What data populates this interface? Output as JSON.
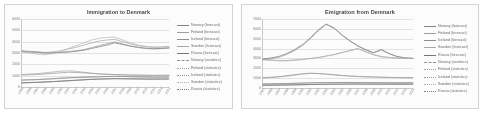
{
  "charts": [
    {
      "id": "immigration",
      "title": "Immigration to Denmark",
      "chart_data": {
        "type": "line",
        "title": "Immigration to Denmark",
        "xlabel": "",
        "ylabel": "",
        "ylim": [
          0,
          6000
        ],
        "yticks": [
          6000,
          5000,
          4000,
          3000,
          2000,
          1000,
          0
        ],
        "grid": true,
        "legend_position": "right",
        "categories": [
          "1995",
          "1996",
          "1997",
          "1998",
          "1999",
          "2000",
          "2001",
          "2002",
          "2003",
          "2004",
          "2005",
          "2006",
          "2007",
          "2008",
          "2009",
          "2010",
          "2011",
          "2012",
          "2013",
          "2014"
        ],
        "series": [
          {
            "name": "Norway (forecast)",
            "style": "solid",
            "color": "#7f7f7f",
            "values": [
              3120,
              3080,
              3050,
              3000,
              3020,
              3050,
              3080,
              3150,
              3250,
              3400,
              3550,
              3700,
              3900,
              3750,
              3620,
              3500,
              3420,
              3380,
              3400,
              3450
            ]
          },
          {
            "name": "Finland (forecast)",
            "style": "solid",
            "color": "#9a9a9a",
            "values": [
              1050,
              1080,
              1100,
              1150,
              1200,
              1250,
              1300,
              1280,
              1250,
              1200,
              1150,
              1120,
              1100,
              1080,
              1060,
              1050,
              1040,
              1030,
              1030,
              1040
            ]
          },
          {
            "name": "Iceland (forecast)",
            "style": "solid",
            "color": "#8c8c8c",
            "values": [
              620,
              640,
              660,
              690,
              720,
              760,
              800,
              830,
              860,
              880,
              900,
              920,
              940,
              930,
              910,
              890,
              880,
              870,
              870,
              880
            ]
          },
          {
            "name": "Sweden (forecast)",
            "style": "solid",
            "color": "#a5a5a5",
            "values": [
              3150,
              3100,
              3080,
              3050,
              3100,
              3200,
              3350,
              3500,
              3700,
              3900,
              4050,
              4150,
              4200,
              4000,
              3800,
              3650,
              3550,
              3500,
              3520,
              3560
            ]
          },
          {
            "name": "Russia (forecast)",
            "style": "solid",
            "color": "#707070",
            "values": [
              380,
              400,
              420,
              450,
              480,
              520,
              560,
              600,
              640,
              680,
              700,
              720,
              740,
              730,
              720,
              710,
              700,
              700,
              700,
              710
            ]
          },
          {
            "name": "Norway (statistics)",
            "style": "dashed",
            "color": "#8f8f8f",
            "values": [
              3200,
              3150,
              3100,
              3020,
              3000,
              3050,
              3120,
              3200,
              3300,
              3480,
              3650,
              3820,
              3980,
              3800,
              3600,
              3480,
              3400,
              3360,
              3390,
              3440
            ]
          },
          {
            "name": "Finland (statistics)",
            "style": "dotted",
            "color": "#a0a0a0",
            "values": [
              1100,
              1150,
              1180,
              1250,
              1320,
              1400,
              1420,
              1380,
              1300,
              1220,
              1160,
              1120,
              1100,
              1070,
              1050,
              1040,
              1030,
              1020,
              1025,
              1035
            ]
          },
          {
            "name": "Iceland (statistics)",
            "style": "dotted",
            "color": "#959595",
            "values": [
              600,
              630,
              650,
              700,
              740,
              790,
              820,
              850,
              870,
              890,
              910,
              930,
              950,
              935,
              915,
              895,
              885,
              875,
              875,
              885
            ]
          },
          {
            "name": "Sweden (statistics)",
            "style": "dotted",
            "color": "#b0b0b0",
            "values": [
              3100,
              3000,
              2900,
              2850,
              2950,
              3150,
              3400,
              3650,
              3900,
              4150,
              4300,
              4380,
              4400,
              4150,
              3900,
              3700,
              3580,
              3520,
              3540,
              3580
            ]
          },
          {
            "name": "Russia (statistics)",
            "style": "dotted",
            "color": "#787878",
            "values": [
              350,
              380,
              410,
              440,
              470,
              510,
              550,
              590,
              630,
              670,
              695,
              715,
              735,
              725,
              715,
              705,
              698,
              698,
              700,
              705
            ]
          }
        ]
      }
    },
    {
      "id": "emigration",
      "title": "Emigration from Denmark",
      "chart_data": {
        "type": "line",
        "title": "Emigration from Denmark",
        "xlabel": "",
        "ylabel": "",
        "ylim": [
          0,
          7000
        ],
        "yticks": [
          7000,
          6000,
          5000,
          4000,
          3000,
          2000,
          1000,
          0
        ],
        "grid": true,
        "legend_position": "right",
        "categories": [
          "1995",
          "1996",
          "1997",
          "1998",
          "1999",
          "2000",
          "2001",
          "2002",
          "2003",
          "2004",
          "2005",
          "2006",
          "2007",
          "2008",
          "2009",
          "2010",
          "2011",
          "2012",
          "2013",
          "2014"
        ],
        "series": [
          {
            "name": "Norway (forecast)",
            "style": "solid",
            "color": "#7f7f7f",
            "values": [
              2950,
              3050,
              3200,
              3500,
              3900,
              4400,
              5100,
              5900,
              6500,
              6100,
              5400,
              4800,
              4300,
              3900,
              3600,
              3900,
              3500,
              3200,
              3050,
              3000
            ]
          },
          {
            "name": "Finland (forecast)",
            "style": "solid",
            "color": "#9a9a9a",
            "values": [
              1050,
              1100,
              1150,
              1250,
              1350,
              1450,
              1500,
              1480,
              1420,
              1350,
              1280,
              1220,
              1180,
              1150,
              1120,
              1100,
              1080,
              1060,
              1050,
              1050
            ]
          },
          {
            "name": "Iceland (forecast)",
            "style": "solid",
            "color": "#8c8c8c",
            "values": [
              420,
              430,
              440,
              460,
              480,
              500,
              520,
              540,
              550,
              555,
              560,
              560,
              555,
              550,
              545,
              540,
              535,
              530,
              530,
              535
            ]
          },
          {
            "name": "Sweden (forecast)",
            "style": "solid",
            "color": "#a5a5a5",
            "values": [
              2900,
              2850,
              2800,
              2800,
              2850,
              2900,
              3000,
              3100,
              3250,
              3400,
              3600,
              3800,
              4000,
              3700,
              3400,
              3200,
              3100,
              3050,
              3030,
              3020
            ]
          },
          {
            "name": "Russia (forecast)",
            "style": "solid",
            "color": "#707070",
            "values": [
              280,
              290,
              300,
              310,
              325,
              340,
              355,
              370,
              380,
              390,
              395,
              400,
              400,
              398,
              395,
              392,
              390,
              390,
              390,
              392
            ]
          },
          {
            "name": "Norway (statistics)",
            "style": "dashed",
            "color": "#8f8f8f",
            "values": [
              2900,
              2980,
              3120,
              3400,
              3800,
              4300,
              5000,
              5800,
              6450,
              6050,
              5350,
              4750,
              4250,
              3850,
              3550,
              3850,
              3450,
              3180,
              3030,
              2990
            ]
          },
          {
            "name": "Finland (statistics)",
            "style": "dotted",
            "color": "#a0a0a0",
            "values": [
              1000,
              1050,
              1120,
              1200,
              1300,
              1420,
              1480,
              1460,
              1400,
              1330,
              1260,
              1200,
              1160,
              1130,
              1110,
              1090,
              1070,
              1055,
              1045,
              1045
            ]
          },
          {
            "name": "Iceland (statistics)",
            "style": "dotted",
            "color": "#959595",
            "values": [
              400,
              415,
              430,
              450,
              470,
              495,
              515,
              535,
              548,
              553,
              558,
              558,
              552,
              548,
              543,
              538,
              533,
              528,
              528,
              533
            ]
          },
          {
            "name": "Sweden (statistics)",
            "style": "dotted",
            "color": "#b0b0b0",
            "values": [
              2850,
              2800,
              2750,
              2750,
              2800,
              2880,
              2980,
              3080,
              3220,
              3380,
              3580,
              3780,
              3980,
              3650,
              3350,
              3150,
              3080,
              3030,
              3010,
              3005
            ]
          },
          {
            "name": "Russia (statistics)",
            "style": "dotted",
            "color": "#787878",
            "values": [
              270,
              282,
              294,
              305,
              318,
              333,
              350,
              365,
              376,
              386,
              392,
              397,
              397,
              395,
              392,
              389,
              388,
              388,
              388,
              390
            ]
          }
        ]
      }
    }
  ]
}
